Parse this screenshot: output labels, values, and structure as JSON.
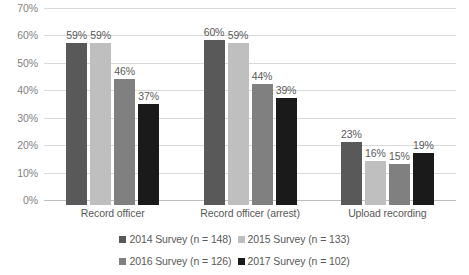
{
  "chart_data": {
    "type": "bar",
    "title": "",
    "subtitle": "",
    "xlabel": "",
    "ylabel": "",
    "ylim": [
      0,
      70
    ],
    "ytick_labels": [
      "0%",
      "10%",
      "20%",
      "30%",
      "40%",
      "50%",
      "60%",
      "70%"
    ],
    "ytick_values": [
      0,
      10,
      20,
      30,
      40,
      50,
      60,
      70
    ],
    "grid": true,
    "legend_position": "bottom",
    "categories": [
      "Record officer",
      "Record officer (arrest)",
      "Upload recording"
    ],
    "series": [
      {
        "name": "2014 Survey (n = 148)",
        "color": "#595959",
        "values": [
          59,
          60,
          23
        ],
        "labels": [
          "59%",
          "60%",
          "23%"
        ]
      },
      {
        "name": "2015 Survey (n = 133)",
        "color": "#bfbfbf",
        "values": [
          59,
          59,
          16
        ],
        "labels": [
          "59%",
          "59%",
          "16%"
        ]
      },
      {
        "name": "2016 Survey (n = 126)",
        "color": "#808080",
        "values": [
          46,
          44,
          15
        ],
        "labels": [
          "46%",
          "44%",
          "15%"
        ]
      },
      {
        "name": "2017 Survey (n = 102)",
        "color": "#1a1a1a",
        "values": [
          37,
          39,
          19
        ],
        "labels": [
          "37%",
          "39%",
          "19%"
        ]
      }
    ]
  },
  "axis": {
    "y_ticks": [
      {
        "label": "70%"
      },
      {
        "label": "60%"
      },
      {
        "label": "50%"
      },
      {
        "label": "40%"
      },
      {
        "label": "30%"
      },
      {
        "label": "20%"
      },
      {
        "label": "10%"
      },
      {
        "label": "0%"
      }
    ],
    "categories": [
      {
        "label": "Record officer"
      },
      {
        "label": "Record officer (arrest)"
      },
      {
        "label": "Upload recording"
      }
    ]
  },
  "legend": {
    "items": [
      {
        "label": "2014 Survey (n = 148)",
        "color": "#595959"
      },
      {
        "label": "2015 Survey (n = 133)",
        "color": "#bfbfbf"
      },
      {
        "label": "2016 Survey (n = 126)",
        "color": "#808080"
      },
      {
        "label": "2017 Survey (n = 102)",
        "color": "#1a1a1a"
      }
    ]
  }
}
